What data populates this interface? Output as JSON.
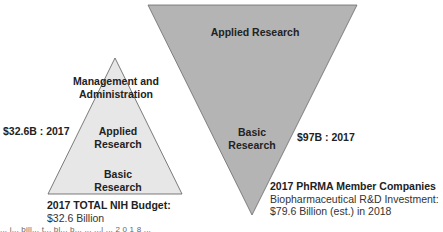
{
  "colors": {
    "nih_fill": "#e7e7e7",
    "pharma_fill": "#b4b4b4",
    "stroke": "#5a5a5a",
    "text": "#222222"
  },
  "nih_triangle": {
    "layers": [
      {
        "line1": "Management and",
        "line2": "Administration"
      },
      {
        "line1": "Applied",
        "line2": "Research"
      },
      {
        "line1": "Basic",
        "line2": "Research"
      }
    ],
    "amount_label": "$32.6B : 2017",
    "caption": {
      "title": "2017 TOTAL NIH Budget:",
      "line1": "$32.6 Billion"
    }
  },
  "pharma_triangle": {
    "layers": [
      {
        "line1": "Applied Research"
      },
      {
        "line1": "Basic",
        "line2": "Research"
      }
    ],
    "amount_label": "$97B : 2017",
    "caption": {
      "title": "2017 PhRMA Member Companies",
      "line1": "Biopharmaceutical R&D Investment:",
      "line2": "$79.6 Billion (est.) in 2018"
    }
  },
  "footnote": "... i... bill... t... bl... b... ... ...l ... 2 0 1 8 ..."
}
